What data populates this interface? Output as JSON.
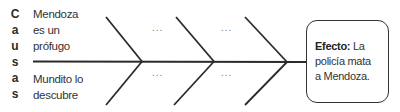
{
  "causes_label_letters": [
    "C",
    "a",
    "u",
    "s",
    "a",
    "s"
  ],
  "causes": {
    "top": [
      "Mendoza",
      "es un",
      "prófugo"
    ],
    "bottom": [
      "Mundito lo",
      "descubre"
    ]
  },
  "placeholders": {
    "branch2_top": "...",
    "branch2_bottom": "...",
    "branch3_top": "...",
    "branch3_bottom": "..."
  },
  "effect": {
    "label": "Efecto:",
    "lines": [
      "La",
      "policía mata",
      "a Mendoza."
    ]
  },
  "colors": {
    "line": "#2b2b2b",
    "text": "#333333"
  }
}
